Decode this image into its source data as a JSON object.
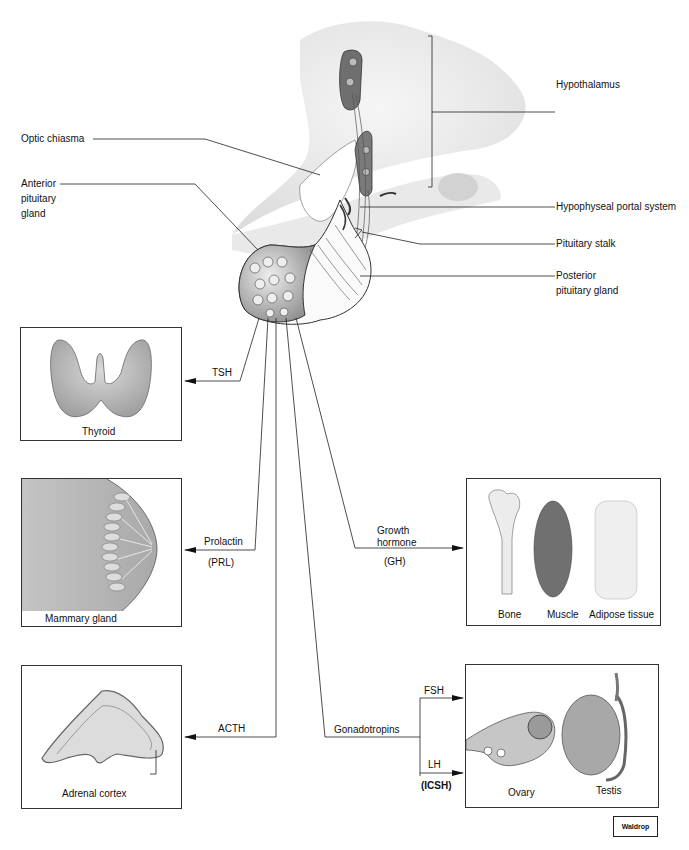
{
  "labels": {
    "hypothalamus": "Hypothalamus",
    "optic_chiasma": "Optic chiasma",
    "anterior_pituitary": [
      "Anterior",
      "pituitary",
      "gland"
    ],
    "hypophyseal_portal": "Hypophyseal portal system",
    "pituitary_stalk": "Pituitary stalk",
    "posterior_pituitary": [
      "Posterior",
      "pituitary gland"
    ]
  },
  "hormones": {
    "tsh": "TSH",
    "prolactin": "Prolactin",
    "prl": "(PRL)",
    "growth_hormone": [
      "Growth",
      "hormone"
    ],
    "gh": "(GH)",
    "acth": "ACTH",
    "gonadotropins": "Gonadotropins",
    "fsh": "FSH",
    "lh": "LH",
    "icsh": "(ICSH)"
  },
  "targets": {
    "thyroid": "Thyroid",
    "mammary": "Mammary gland",
    "bone": "Bone",
    "muscle": "Muscle",
    "adipose": "Adipose tissue",
    "adrenal": "Adrenal cortex",
    "ovary": "Ovary",
    "testis": "Testis"
  },
  "credit": "Waldrop"
}
